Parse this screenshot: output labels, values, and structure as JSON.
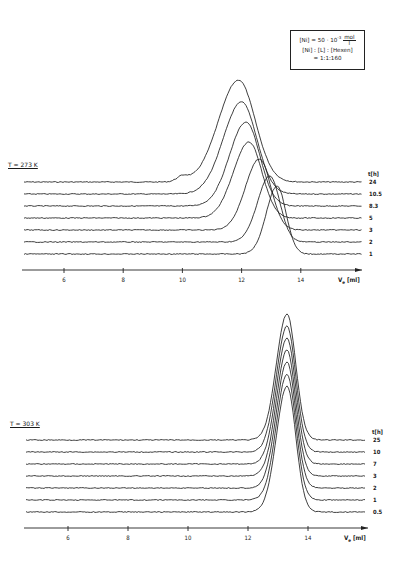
{
  "chart_data": [
    {
      "type": "line",
      "title": "GPC traces at T = 273 K",
      "temperature_label": "T = 273 K",
      "xlabel": "V_e [ml]",
      "ylabel": "",
      "xticks": [
        6,
        8,
        10,
        12,
        14
      ],
      "xlim": [
        4.6,
        16.2
      ],
      "legend_title": "t [h]",
      "annotation": {
        "line1_prefix": "[Ni] = 50 · 10",
        "line1_exp": "-3",
        "line1_unit_num": "mol",
        "line1_unit_den": "l",
        "line2": "[Ni] : [L] : [Hexen]",
        "line3": "= 1:1:160"
      },
      "series": [
        {
          "name": "24",
          "peak_ve": 11.9,
          "peak_height_px": 102,
          "width_ml": 1.15,
          "shoulder_ve": 10.0
        },
        {
          "name": "10.5",
          "peak_ve": 12.0,
          "peak_height_px": 92,
          "width_ml": 1.05
        },
        {
          "name": "8.3",
          "peak_ve": 12.15,
          "peak_height_px": 84,
          "width_ml": 0.95
        },
        {
          "name": "5",
          "peak_ve": 12.25,
          "peak_height_px": 76,
          "width_ml": 0.9
        },
        {
          "name": "3",
          "peak_ve": 12.6,
          "peak_height_px": 71,
          "width_ml": 0.8
        },
        {
          "name": "2",
          "peak_ve": 12.95,
          "peak_height_px": 66,
          "width_ml": 0.7
        },
        {
          "name": "1",
          "peak_ve": 13.2,
          "peak_height_px": 68,
          "width_ml": 0.62
        }
      ]
    },
    {
      "type": "line",
      "title": "GPC traces at T = 303 K",
      "temperature_label": "T = 303 K",
      "xlabel": "V_e [ml]",
      "ylabel": "",
      "xticks": [
        6,
        8,
        10,
        12,
        14
      ],
      "xlim": [
        4.6,
        16.2
      ],
      "legend_title": "t [h]",
      "series": [
        {
          "name": "25",
          "peak_ve": 13.3,
          "peak_height_px": 126,
          "width_ml": 0.6
        },
        {
          "name": "10",
          "peak_ve": 13.3,
          "peak_height_px": 126,
          "width_ml": 0.6
        },
        {
          "name": "7",
          "peak_ve": 13.3,
          "peak_height_px": 126,
          "width_ml": 0.6
        },
        {
          "name": "3",
          "peak_ve": 13.3,
          "peak_height_px": 126,
          "width_ml": 0.6
        },
        {
          "name": "2",
          "peak_ve": 13.3,
          "peak_height_px": 126,
          "width_ml": 0.6
        },
        {
          "name": "1",
          "peak_ve": 13.3,
          "peak_height_px": 126,
          "width_ml": 0.6
        },
        {
          "name": "0.5",
          "peak_ve": 13.3,
          "peak_height_px": 126,
          "width_ml": 0.6
        }
      ]
    }
  ],
  "layout": {
    "top": {
      "axis_y": 270,
      "x_left": 22,
      "x_right": 362,
      "x_origin_px": 64,
      "x_origin_val": 6,
      "px_per_ml": 29.6,
      "baselines": [
        182,
        194,
        206,
        218,
        230,
        242,
        254
      ],
      "label_x": 368,
      "legend_title_y": 176
    },
    "bottom": {
      "axis_y": 528,
      "x_left": 24,
      "x_right": 368,
      "x_origin_px": 68,
      "x_origin_val": 6,
      "px_per_ml": 30.0,
      "baselines": [
        440,
        452,
        464,
        476,
        488,
        500,
        512
      ],
      "label_x": 372,
      "legend_title_y": 434
    }
  }
}
